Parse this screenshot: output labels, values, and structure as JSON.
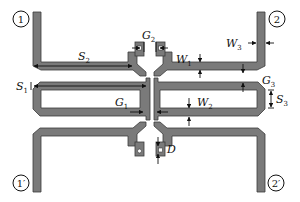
{
  "diagram": {
    "colors": {
      "trace": "#7a7a7a",
      "outline": "#3a3a3a",
      "background": "#ffffff",
      "annotation": "#111111"
    },
    "ports": [
      {
        "id": "p1",
        "label": "1"
      },
      {
        "id": "p2",
        "label": "2"
      },
      {
        "id": "p1p",
        "label": "1′"
      },
      {
        "id": "p2p",
        "label": "2′"
      }
    ],
    "dimensions": {
      "S2": {
        "main": "S",
        "sub": "2"
      },
      "G2": {
        "main": "G",
        "sub": "2"
      },
      "W1": {
        "main": "W",
        "sub": "1"
      },
      "W3": {
        "main": "W",
        "sub": "3"
      },
      "G3": {
        "main": "G",
        "sub": "3"
      },
      "S1": {
        "main": "S",
        "sub": "1"
      },
      "S3": {
        "main": "S",
        "sub": "3"
      },
      "G1": {
        "main": "G",
        "sub": "1"
      },
      "W2": {
        "main": "W",
        "sub": "2"
      },
      "D": {
        "main": "D",
        "sub": ""
      }
    }
  }
}
